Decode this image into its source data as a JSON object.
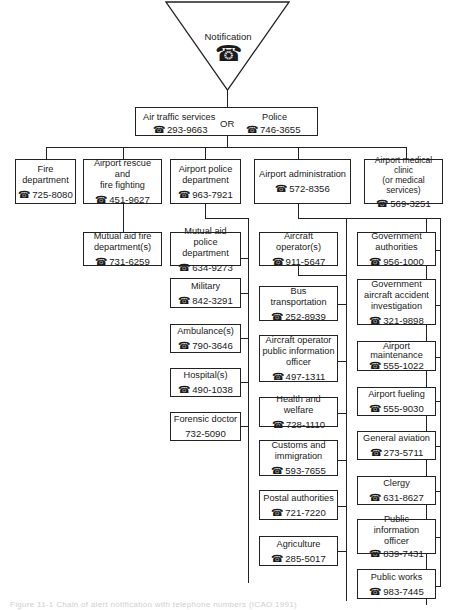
{
  "notification": {
    "label": "Notification",
    "icon": "telephone-icon"
  },
  "first_contact": {
    "left": {
      "label": "Air traffic services",
      "phone": "293-9663"
    },
    "connector": "OR",
    "right": {
      "label": "Police",
      "phone": "746-3655"
    }
  },
  "level2": [
    {
      "label": "Fire\ndepartment",
      "phone": "725-8080"
    },
    {
      "label": "Airport rescue and\nfire fighting",
      "phone": "451-9627"
    },
    {
      "label": "Airport police\ndepartment",
      "phone": "963-7921"
    },
    {
      "label": "Airport administration",
      "phone": "572-8356"
    },
    {
      "label": "Airport medical\nclinic\n(or medical services)",
      "phone": "569-3251"
    }
  ],
  "rescue_children": [
    {
      "label": "Mutual aid fire\ndepartment(s)",
      "phone": "731-6259"
    }
  ],
  "police_children": [
    {
      "label": "Mutual aid police\ndepartment",
      "phone": "634-9273"
    },
    {
      "label": "Military",
      "phone": "842-3291"
    },
    {
      "label": "Ambulance(s)",
      "phone": "790-3646"
    },
    {
      "label": "Hospital(s)",
      "phone": "490-1038"
    },
    {
      "label": "Forensic doctor",
      "phone": "732-5090"
    }
  ],
  "admin_children_left": [
    {
      "label": "Aircraft\noperator(s)",
      "phone": "911-5647"
    },
    {
      "label": "Bus\ntransportation",
      "phone": "252-8939"
    },
    {
      "label": "Aircraft operator\npublic information\nofficer",
      "phone": "497-1311"
    },
    {
      "label": "Health and welfare",
      "phone": "728-1110"
    },
    {
      "label": "Customs and\nimmigration",
      "phone": "593-7655"
    },
    {
      "label": "Postal authorities",
      "phone": "721-7220"
    },
    {
      "label": "Agriculture",
      "phone": "285-5017"
    }
  ],
  "admin_children_right": [
    {
      "label": "Government\nauthorities",
      "phone": "956-1000"
    },
    {
      "label": "Government\naircraft accident\ninvestigation",
      "phone": "321-9898"
    },
    {
      "label": "Airport\nmaintenance",
      "phone": "555-1022"
    },
    {
      "label": "Airport fueling",
      "phone": "555-9030"
    },
    {
      "label": "General aviation",
      "phone": "273-5711"
    },
    {
      "label": "Clergy",
      "phone": "631-8627"
    },
    {
      "label": "Public information\nofficer",
      "phone": "839-7431"
    },
    {
      "label": "Public works",
      "phone": "983-7445"
    }
  ],
  "glyphs": {
    "phone": "☎"
  },
  "caption": "Figure 11-1  Chain of alert notification with telephone numbers (ICAO 1991)"
}
